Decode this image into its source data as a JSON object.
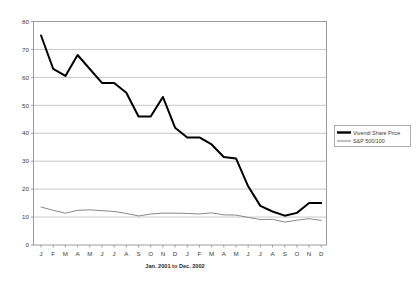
{
  "chart_data": {
    "type": "line",
    "title": "",
    "xlabel": "Jan. 2001 to Dec. 2002",
    "ylabel": "",
    "ylim": [
      0,
      80
    ],
    "yticks": [
      0,
      10,
      20,
      30,
      40,
      50,
      60,
      70,
      80
    ],
    "grid": true,
    "grid_axis": "y",
    "legend_position": "right",
    "categories": [
      "J",
      "F",
      "M",
      "A",
      "M",
      "J",
      "J",
      "A",
      "S",
      "O",
      "N",
      "D",
      "J",
      "F",
      "M",
      "A",
      "M",
      "J",
      "J",
      "A",
      "S",
      "O",
      "N",
      "D"
    ],
    "x_tick_labels": [
      "J",
      "F",
      "M",
      "A",
      "M",
      "J",
      "J",
      "A",
      "S",
      "O",
      "N",
      "D",
      "J",
      "F",
      "M",
      "A",
      "M",
      "J",
      "J",
      "A",
      "S",
      "O",
      "N",
      "D"
    ],
    "series": [
      {
        "name": "Vivendi Share Price",
        "color": "#000000",
        "line_width": 2.0,
        "values": [
          75,
          63,
          60.5,
          68,
          63,
          58,
          58,
          54.5,
          46,
          46,
          53,
          42,
          38.5,
          38.5,
          36,
          31.5,
          31,
          21,
          14,
          12,
          10.5,
          11.5,
          15,
          15
        ]
      },
      {
        "name": "S&P 500/100",
        "color": "#7a7a7a",
        "line_width": 0.9,
        "values": [
          13.6,
          12.4,
          11.4,
          12.4,
          12.6,
          12.3,
          12.0,
          11.3,
          10.4,
          11.1,
          11.4,
          11.4,
          11.3,
          11.1,
          11.5,
          10.8,
          10.7,
          9.9,
          9.1,
          9.2,
          8.2,
          8.9,
          9.4,
          8.8
        ]
      }
    ],
    "annotations": []
  },
  "legend": {
    "items": [
      {
        "label": "Vivendi Share Price",
        "swatch": "thick-black-line"
      },
      {
        "label": "S&P 500/100",
        "swatch": "thin-gray-line"
      }
    ]
  },
  "axes": {
    "x_axis_title": "Jan. 2001 to Dec. 2002",
    "y_tick_labels": [
      "0",
      "10",
      "20",
      "30",
      "40",
      "50",
      "60",
      "70",
      "80"
    ],
    "x_tick_labels": [
      "J",
      "F",
      "M",
      "A",
      "M",
      "J",
      "J",
      "A",
      "S",
      "O",
      "N",
      "D",
      "J",
      "F",
      "M",
      "A",
      "M",
      "J",
      "J",
      "A",
      "S",
      "O",
      "N",
      "D"
    ]
  },
  "colors": {
    "plot_border": "#9a9a9a",
    "gridline": "#b9b9b9",
    "axis_line": "#8a8a8a",
    "vivendi": "#000000",
    "sp500": "#7a7a7a",
    "background": "#ffffff"
  }
}
